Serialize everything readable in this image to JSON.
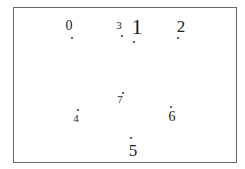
{
  "diagram": {
    "border_color": "#666666",
    "points": [
      {
        "label": "0",
        "x": 69,
        "y": 26,
        "size": 14,
        "dot_x": 71,
        "dot_y": 37
      },
      {
        "label": "3",
        "x": 119,
        "y": 25,
        "size": 11,
        "dot_x": 121,
        "dot_y": 35
      },
      {
        "label": "1",
        "x": 137,
        "y": 27,
        "size": 22,
        "dot_x": 133,
        "dot_y": 41
      },
      {
        "label": "2",
        "x": 181,
        "y": 26,
        "size": 17,
        "dot_x": 177,
        "dot_y": 37
      },
      {
        "label": "7",
        "x": 120,
        "y": 99,
        "size": 11,
        "dot_x": 122,
        "dot_y": 92
      },
      {
        "label": "4",
        "x": 76,
        "y": 118,
        "size": 11,
        "dot_x": 77,
        "dot_y": 109
      },
      {
        "label": "6",
        "x": 172,
        "y": 117,
        "size": 14,
        "dot_x": 170,
        "dot_y": 106
      },
      {
        "label": "5",
        "x": 133,
        "y": 150,
        "size": 17,
        "dot_x": 130,
        "dot_y": 137
      }
    ]
  }
}
